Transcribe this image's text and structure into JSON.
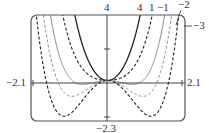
{
  "chart_data": {
    "type": "line",
    "title": "",
    "function": "y = x^4 + c*x^2",
    "xlabel": "",
    "ylabel": "",
    "xlim": [
      -2.1,
      2.1
    ],
    "ylim": [
      -2.3,
      4
    ],
    "x_tick_labels": [
      "-2.1",
      "2.1"
    ],
    "y_tick_labels": [
      "4",
      "-2.3"
    ],
    "grid": false,
    "series": [
      {
        "name": "4",
        "c": 4,
        "style": "solid",
        "color": "#222222",
        "width": 1.3
      },
      {
        "name": "1",
        "c": 1,
        "style": "dashed",
        "color": "#222222",
        "width": 1.1
      },
      {
        "name": "-1",
        "c": -1,
        "style": "solid",
        "color": "#8a8a8a",
        "width": 1.0
      },
      {
        "name": "-2",
        "c": -2,
        "style": "dashed",
        "color": "#8a8a8a",
        "width": 1.0
      },
      {
        "name": "-3",
        "c": -3,
        "style": "dashed",
        "color": "#222222",
        "width": 1.1
      }
    ],
    "annotations": [
      "4",
      "1",
      "−1",
      "−2",
      "−3"
    ]
  },
  "labels": {
    "ymax": "4",
    "ymin": "−2.3",
    "xmin": "−2.1",
    "xmax": "2.1",
    "curve_4": "4",
    "curve_1": "1",
    "curve_m1": "−1",
    "curve_m2": "−2",
    "curve_m3": "−3"
  }
}
